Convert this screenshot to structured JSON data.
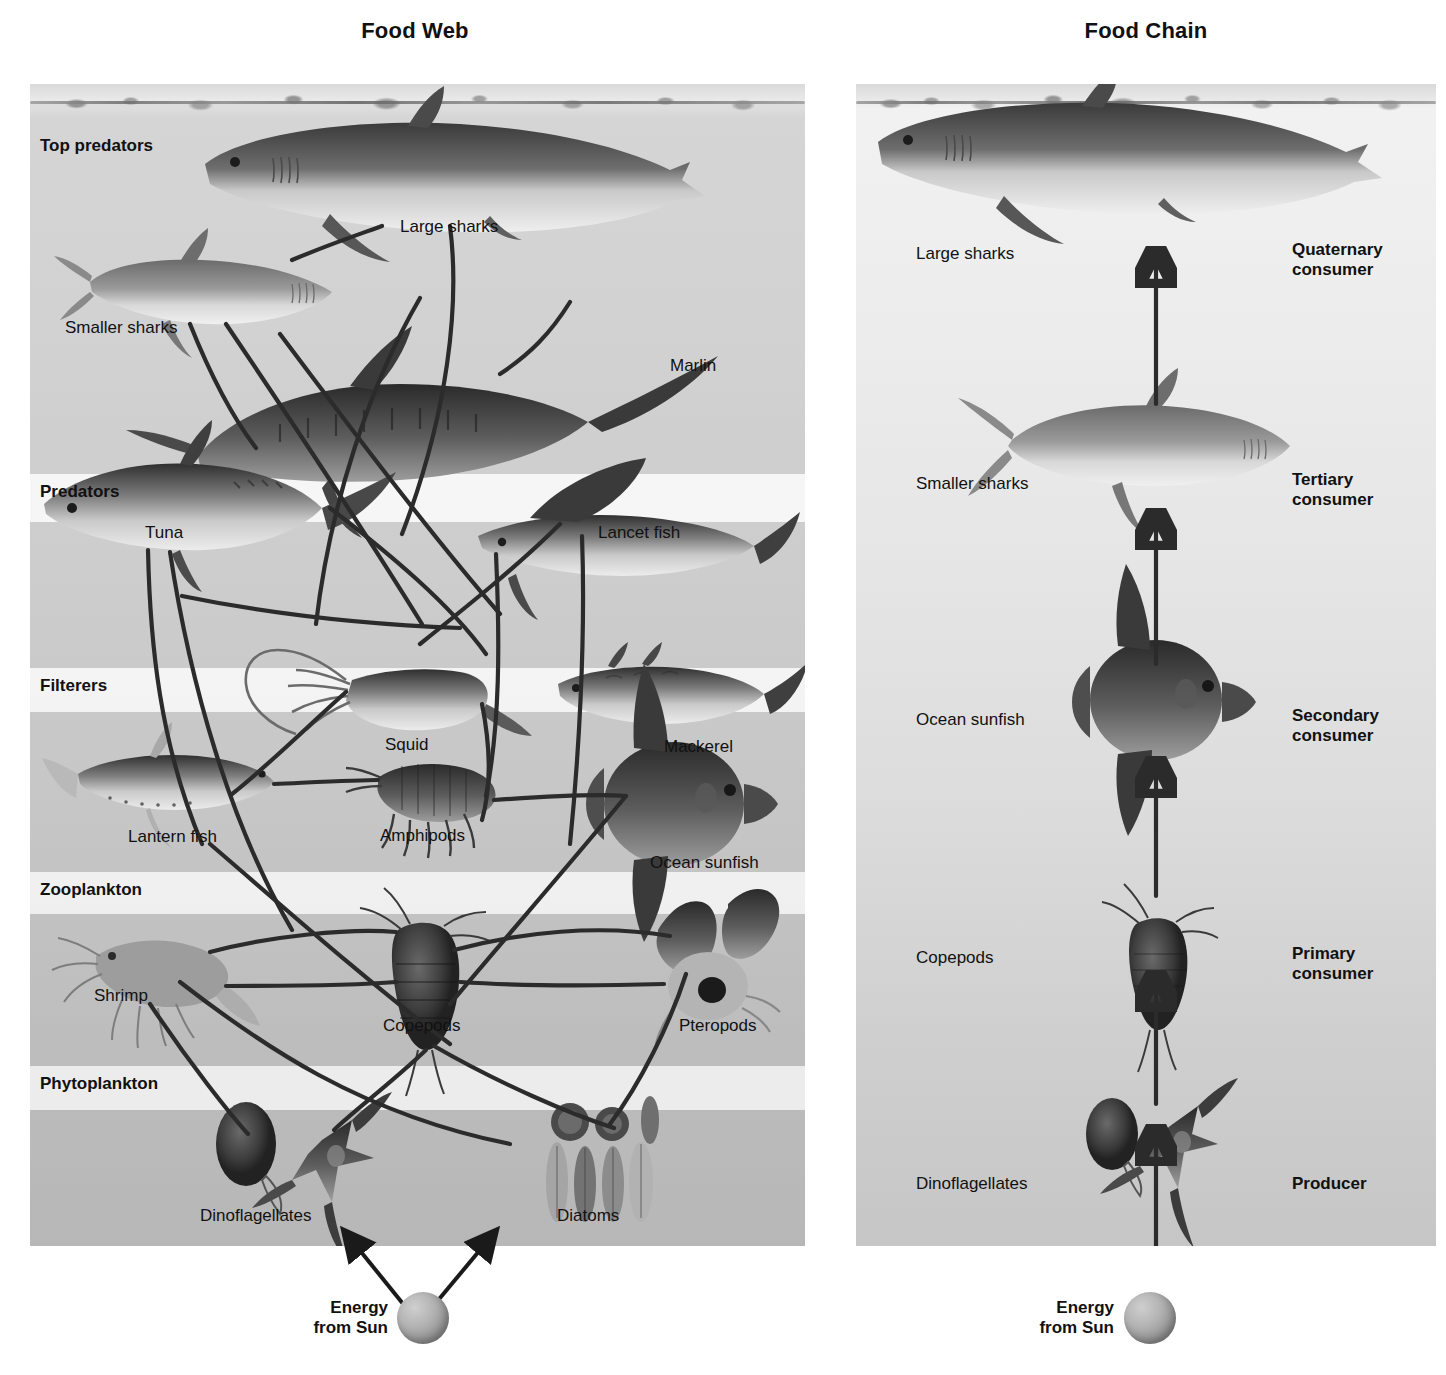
{
  "web": {
    "title": "Food Web",
    "zones": [
      {
        "id": "top-predators",
        "label": "Top predators"
      },
      {
        "id": "predators",
        "label": "Predators"
      },
      {
        "id": "filterers",
        "label": "Filterers"
      },
      {
        "id": "zooplankton",
        "label": "Zooplankton"
      },
      {
        "id": "phytoplankton",
        "label": "Phytoplankton"
      }
    ],
    "organisms": [
      {
        "id": "large-sharks",
        "label": "Large sharks"
      },
      {
        "id": "smaller-sharks",
        "label": "Smaller sharks"
      },
      {
        "id": "marlin",
        "label": "Marlin"
      },
      {
        "id": "tuna",
        "label": "Tuna"
      },
      {
        "id": "lancet-fish",
        "label": "Lancet fish"
      },
      {
        "id": "squid",
        "label": "Squid"
      },
      {
        "id": "mackerel",
        "label": "Mackerel"
      },
      {
        "id": "lantern-fish",
        "label": "Lantern fish"
      },
      {
        "id": "amphipods",
        "label": "Amphipods"
      },
      {
        "id": "ocean-sunfish",
        "label": "Ocean sunfish"
      },
      {
        "id": "shrimp",
        "label": "Shrimp"
      },
      {
        "id": "copepods",
        "label": "Copepods"
      },
      {
        "id": "pteropods",
        "label": "Pteropods"
      },
      {
        "id": "dinoflagellates",
        "label": "Dinoflagellates"
      },
      {
        "id": "diatoms",
        "label": "Diatoms"
      }
    ],
    "energy": {
      "line1": "Energy",
      "line2": "from Sun"
    }
  },
  "chain": {
    "title": "Food Chain",
    "levels": [
      {
        "organism": "Large sharks",
        "trophic_line1": "Quaternary",
        "trophic_line2": "consumer"
      },
      {
        "organism": "Smaller sharks",
        "trophic_line1": "Tertiary",
        "trophic_line2": "consumer"
      },
      {
        "organism": "Ocean sunfish",
        "trophic_line1": "Secondary",
        "trophic_line2": "consumer"
      },
      {
        "organism": "Copepods",
        "trophic_line1": "Primary",
        "trophic_line2": "consumer"
      },
      {
        "organism": "Dinoflagellates",
        "trophic_line1": "Producer",
        "trophic_line2": ""
      }
    ],
    "energy": {
      "line1": "Energy",
      "line2": "from Sun"
    }
  },
  "colors": {
    "ink": "#111111",
    "line": "#2b2b2b",
    "water_top": "#f2f2f2",
    "water_bottom": "#c6c6c6",
    "band_shade": "#969696"
  }
}
